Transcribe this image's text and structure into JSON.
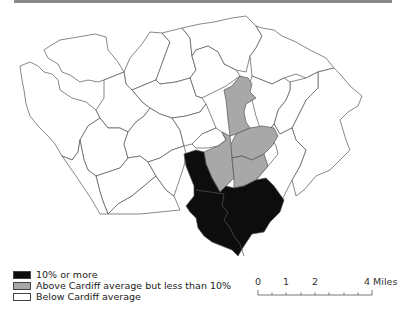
{
  "map": {
    "subject": "Cardiff wards",
    "colors": {
      "high": "#0d0d0d",
      "above_average": "#a8a8a8",
      "below_average": "#ffffff",
      "boundary": "#555555",
      "river": "#bdbdbd"
    }
  },
  "legend": {
    "items": [
      {
        "label": "10% or more",
        "color": "#0d0d0d"
      },
      {
        "label": "Above Cardiff average but less than 10%",
        "color": "#a8a8a8"
      },
      {
        "label": "Below Cardiff average",
        "color": "#ffffff"
      }
    ]
  },
  "scale_bar": {
    "labels": [
      "0",
      "1",
      "2",
      "4 Miles"
    ]
  }
}
